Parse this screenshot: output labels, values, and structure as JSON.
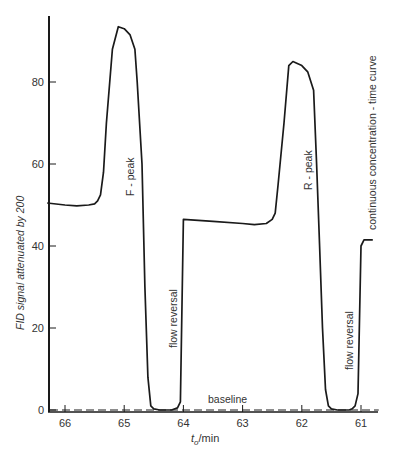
{
  "chart_data": {
    "type": "line",
    "title": "",
    "xlabel": "t_o/min",
    "xlabel_main": "t",
    "xlabel_sub": "o",
    "xlabel_unit": "/min",
    "ylabel": "FID signal attenuated by 200",
    "xlim": [
      66.3,
      60.7
    ],
    "x_reversed": true,
    "ylim": [
      0,
      96
    ],
    "x_ticks": [
      66,
      65,
      64,
      63,
      62,
      61
    ],
    "x_tick_labels": [
      "66",
      "65",
      "64",
      "63",
      "62",
      "61"
    ],
    "y_ticks": [
      0,
      20,
      40,
      60,
      80
    ],
    "y_tick_labels": [
      "0",
      "20",
      "40",
      "60",
      "80"
    ],
    "grid": false,
    "legend": null,
    "series": [
      {
        "name": "FID signal",
        "style": "solid",
        "x": [
          66.3,
          66.0,
          65.8,
          65.6,
          65.5,
          65.45,
          65.4,
          65.35,
          65.3,
          65.2,
          65.1,
          65.0,
          64.9,
          64.82,
          64.78,
          64.7,
          64.65,
          64.6,
          64.55,
          64.5,
          64.4,
          64.3,
          64.2,
          64.1,
          64.05,
          64.0,
          63.5,
          63.0,
          62.8,
          62.6,
          62.5,
          62.45,
          62.4,
          62.3,
          62.22,
          62.15,
          62.0,
          61.9,
          61.8,
          61.75,
          61.7,
          61.65,
          61.6,
          61.55,
          61.5,
          61.4,
          61.3,
          61.2,
          61.15,
          61.1,
          61.05,
          61.0,
          60.95,
          60.9,
          60.8
        ],
        "y": [
          50.5,
          50.0,
          49.8,
          50.0,
          50.3,
          51.0,
          52.5,
          58.0,
          70.0,
          88.0,
          93.5,
          93.0,
          91.5,
          88.0,
          80.0,
          60.0,
          30.0,
          8.0,
          1.0,
          0.3,
          0.0,
          0.0,
          0.0,
          0.5,
          2.0,
          46.5,
          46.0,
          45.5,
          45.2,
          45.5,
          46.5,
          48.0,
          55.0,
          70.0,
          84.0,
          85.0,
          84.0,
          82.5,
          78.0,
          60.0,
          40.0,
          20.0,
          5.0,
          1.0,
          0.3,
          0.0,
          0.0,
          0.0,
          0.3,
          1.0,
          4.0,
          40.0,
          41.5,
          41.5,
          41.5
        ]
      },
      {
        "name": "baseline",
        "style": "dashed",
        "x": [
          66.3,
          60.7
        ],
        "y": [
          0.0,
          0.0
        ]
      }
    ],
    "annotations": [
      {
        "text": "F - peak",
        "x": 64.95,
        "y": 70,
        "rotation": -90
      },
      {
        "text": "flow reversal",
        "x": 64.15,
        "y": 22,
        "rotation": -90
      },
      {
        "text": "baseline",
        "x": 63.5,
        "y": 2.5,
        "rotation": 0
      },
      {
        "text": "R - peak",
        "x": 62.0,
        "y": 70,
        "rotation": -90
      },
      {
        "text": "flow reversal",
        "x": 61.3,
        "y": 20,
        "rotation": -90
      },
      {
        "text": "continuous concentration - time curve",
        "x": 60.95,
        "y": 75,
        "rotation": -90
      }
    ]
  },
  "labels": {
    "y_axis": "FID signal attenuated by 200",
    "x_axis_main": "t",
    "x_axis_sub": "o",
    "x_axis_unit": "/min",
    "f_peak": "F - peak",
    "r_peak": "R - peak",
    "flow_reversal_1": "flow reversal",
    "flow_reversal_2": "flow reversal",
    "baseline": "baseline",
    "continuous_curve": "continuous concentration - time curve"
  },
  "colors": {
    "line": "#1a1a1a",
    "text": "#333333",
    "background": "#ffffff"
  }
}
